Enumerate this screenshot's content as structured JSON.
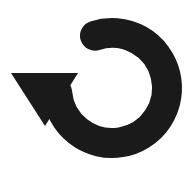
{
  "canvas": {
    "width": 192,
    "height": 181,
    "background_color": "#ffffff"
  },
  "icon": {
    "name": "refresh-counterclockwise-icon",
    "label": "Reload",
    "role": "img",
    "alt_text": "Circular arrow pointing down-left",
    "fill_color": "#1a1a1a",
    "geometry": {
      "arc": {
        "center_x": 112,
        "center_y": 88,
        "outer_radius": 70,
        "inner_radius": 40,
        "stroke_width": 30,
        "start_angle_deg": 252,
        "end_angle_deg": 175,
        "sweep_direction": "clockwise",
        "start_cap": "round",
        "end_cap": "butt"
      },
      "arrowhead": {
        "shape": "triangle",
        "direction": "down",
        "left_x": 11,
        "right_x": 78,
        "top_y": 73,
        "tip_x": 45,
        "tip_y": 126
      }
    }
  }
}
